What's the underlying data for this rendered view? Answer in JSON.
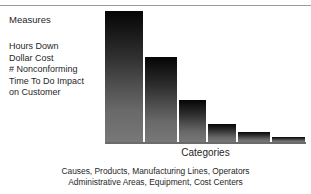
{
  "figure": {
    "clipped_title": "Pareto",
    "categories_axis_label": "Categories",
    "caption_lines": [
      "Causes, Products, Manufacturing Lines, Operators",
      "Administrative Areas, Equipment, Cost Centers"
    ]
  },
  "measures": {
    "heading": "Measures",
    "items": [
      "Hours Down",
      "Dollar Cost",
      "# Nonconforming",
      "Time To Do Impact",
      "on Customer"
    ]
  },
  "colors": {
    "bar_top": "#050505",
    "bar_bottom": "#787878",
    "axis": "#6b6b6b",
    "rule": "#9a9a9a",
    "text": "#1f1f1f",
    "background": "#ffffff"
  },
  "chart_data": {
    "type": "bar",
    "title": "Pareto",
    "xlabel": "Categories",
    "ylabel": "",
    "categories": [
      "1",
      "2",
      "3",
      "4",
      "5",
      "6"
    ],
    "values": [
      132,
      86,
      42,
      18,
      10,
      5
    ],
    "ylim": [
      0,
      135
    ],
    "grid": false,
    "legend": null,
    "bar_widths_px": [
      39,
      34,
      29,
      30,
      34,
      35
    ],
    "annotations": [
      "Measures: Hours Down, Dollar Cost, # Nonconforming, Time To Do Impact on Customer",
      "Causes, Products, Manufacturing Lines, Operators",
      "Administrative Areas, Equipment, Cost Centers"
    ]
  }
}
